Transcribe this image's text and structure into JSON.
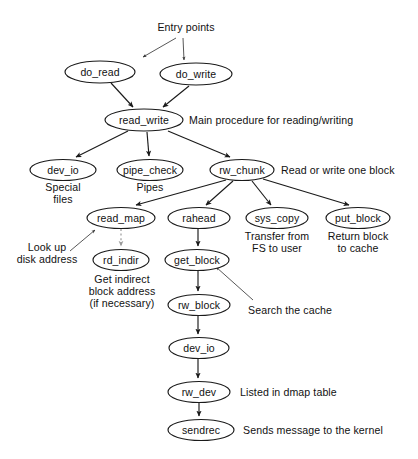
{
  "diagram": {
    "title": "Entry points",
    "type": "call-graph",
    "nodes": [
      {
        "id": "do_read",
        "label": "do_read",
        "cx": 100,
        "cy": 72,
        "rx": 35,
        "ry": 11
      },
      {
        "id": "do_write",
        "label": "do_write",
        "cx": 196,
        "cy": 74,
        "rx": 36,
        "ry": 11
      },
      {
        "id": "read_write",
        "label": "read_write",
        "cx": 144,
        "cy": 120,
        "rx": 39,
        "ry": 11
      },
      {
        "id": "dev_io",
        "label": "dev_io",
        "cx": 63,
        "cy": 170,
        "rx": 33,
        "ry": 10.5
      },
      {
        "id": "pipe_check",
        "label": "pipe_check",
        "cx": 150,
        "cy": 170,
        "rx": 33,
        "ry": 10.5
      },
      {
        "id": "rw_chunk",
        "label": "rw_chunk",
        "cx": 242,
        "cy": 170,
        "rx": 32,
        "ry": 10.5
      },
      {
        "id": "read_map",
        "label": "read_map",
        "cx": 121,
        "cy": 218,
        "rx": 34,
        "ry": 10.5
      },
      {
        "id": "rahead",
        "label": "rahead",
        "cx": 199,
        "cy": 218,
        "rx": 31,
        "ry": 10.5
      },
      {
        "id": "sys_copy",
        "label": "sys_copy",
        "cx": 277,
        "cy": 218,
        "rx": 31,
        "ry": 10.5
      },
      {
        "id": "put_block",
        "label": "put_block",
        "cx": 358,
        "cy": 218,
        "rx": 32,
        "ry": 10.5
      },
      {
        "id": "rd_indir",
        "label": "rd_indir",
        "cx": 121,
        "cy": 260,
        "rx": 28,
        "ry": 10.5
      },
      {
        "id": "get_block",
        "label": "get_block",
        "cx": 197,
        "cy": 260,
        "rx": 32,
        "ry": 10.5
      },
      {
        "id": "rw_block",
        "label": "rw_block",
        "cx": 199,
        "cy": 305,
        "rx": 31,
        "ry": 10.5
      },
      {
        "id": "dev_io_2",
        "label": "dev_io",
        "cx": 199,
        "cy": 348,
        "rx": 30,
        "ry": 10.5
      },
      {
        "id": "rw_dev",
        "label": "rw_dev",
        "cx": 199,
        "cy": 392,
        "rx": 31,
        "ry": 10.5
      },
      {
        "id": "sendrec",
        "label": "sendrec",
        "cx": 201,
        "cy": 430,
        "rx": 33,
        "ry": 10.5
      }
    ],
    "edges": [
      {
        "from": "do_read",
        "to": "read_write",
        "style": "solid"
      },
      {
        "from": "do_write",
        "to": "read_write",
        "style": "solid"
      },
      {
        "from": "read_write",
        "to": "dev_io",
        "style": "solid"
      },
      {
        "from": "read_write",
        "to": "pipe_check",
        "style": "solid"
      },
      {
        "from": "read_write",
        "to": "rw_chunk",
        "style": "solid"
      },
      {
        "from": "rw_chunk",
        "to": "read_map",
        "style": "solid"
      },
      {
        "from": "rw_chunk",
        "to": "rahead",
        "style": "solid"
      },
      {
        "from": "rw_chunk",
        "to": "sys_copy",
        "style": "solid"
      },
      {
        "from": "rw_chunk",
        "to": "put_block",
        "style": "solid"
      },
      {
        "from": "read_map",
        "to": "rd_indir",
        "style": "dotted"
      },
      {
        "from": "rahead",
        "to": "get_block",
        "style": "solid"
      },
      {
        "from": "get_block",
        "to": "rw_block",
        "style": "solid"
      },
      {
        "from": "rw_block",
        "to": "dev_io_2",
        "style": "solid"
      },
      {
        "from": "dev_io_2",
        "to": "rw_dev",
        "style": "solid"
      },
      {
        "from": "rw_dev",
        "to": "sendrec",
        "style": "solid"
      }
    ],
    "annotations": [
      {
        "id": "entry-points",
        "text": "Entry points",
        "lines": [
          "Entry points"
        ]
      },
      {
        "id": "read-write-note",
        "text": "Main procedure for reading/writing",
        "lines": [
          "Main procedure for reading/writing"
        ]
      },
      {
        "id": "dev-io-note",
        "text": "Special files",
        "lines": [
          "Special",
          "files"
        ]
      },
      {
        "id": "pipe-check-note",
        "text": "Pipes",
        "lines": [
          "Pipes"
        ]
      },
      {
        "id": "rw-chunk-note",
        "text": "Read or write one block",
        "lines": [
          "Read or write one block"
        ]
      },
      {
        "id": "read-map-note",
        "text": "Look up disk address",
        "lines": [
          "Look up",
          "disk address"
        ]
      },
      {
        "id": "rd-indir-note",
        "text": "Get indirect block address (if necessary)",
        "lines": [
          "Get indirect",
          "block address",
          "(if necessary)"
        ]
      },
      {
        "id": "sys-copy-note",
        "text": "Transfer from FS to user",
        "lines": [
          "Transfer from",
          "FS to user"
        ]
      },
      {
        "id": "put-block-note",
        "text": "Return block to cache",
        "lines": [
          "Return block",
          "to cache"
        ]
      },
      {
        "id": "get-block-note",
        "text": "Search the cache",
        "lines": [
          "Search the cache"
        ]
      },
      {
        "id": "rw-dev-note",
        "text": "Listed in dmap table",
        "lines": [
          "Listed in dmap table"
        ]
      },
      {
        "id": "sendrec-note",
        "text": "Sends message to the kernel",
        "lines": [
          "Sends message to the kernel"
        ]
      }
    ],
    "colors": {
      "stroke": "#1a1a1a",
      "text": "#111111",
      "dotted": "#9a9a9a",
      "background": "#ffffff"
    }
  }
}
